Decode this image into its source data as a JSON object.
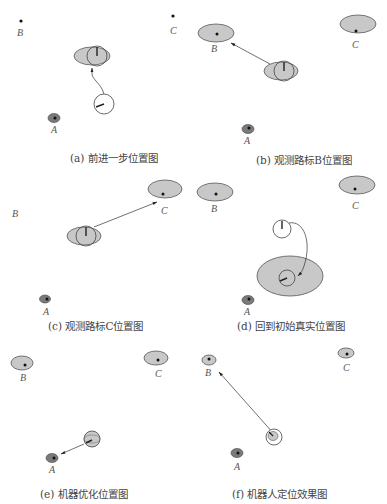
{
  "figure": {
    "colors": {
      "ellipse_fill": "#c8c8c8",
      "ellipse_stroke": "#555555",
      "landmark_A_fill": "#7a7a7a",
      "dot": "#111111",
      "line": "#333333",
      "caption": "#444444"
    },
    "landmark_labels": {
      "A": "A",
      "B": "B",
      "C": "C"
    },
    "panels": [
      {
        "id": "a",
        "caption": "(a) 前进一步位置图",
        "description": "Robot moves forward one step; pose uncertainty grows into grey ellipse"
      },
      {
        "id": "b",
        "caption": "(b) 观测路标B位置图",
        "description": "Robot observes landmark B; arrow points from robot to B"
      },
      {
        "id": "c",
        "caption": "(c) 观测路标C位置图",
        "description": "Robot observes landmark C; arrow points from robot to C"
      },
      {
        "id": "d",
        "caption": "(d) 回到初始真实位置图",
        "description": "Robot returns to initial true position with large uncertainty ellipse"
      },
      {
        "id": "e",
        "caption": "(e) 机器优化位置图",
        "description": "Robot observes landmark A and optimizes its position"
      },
      {
        "id": "f",
        "caption": "(f) 机器人定位效果图",
        "description": "Final robot localization result with reduced uncertainty, observing B"
      }
    ]
  }
}
